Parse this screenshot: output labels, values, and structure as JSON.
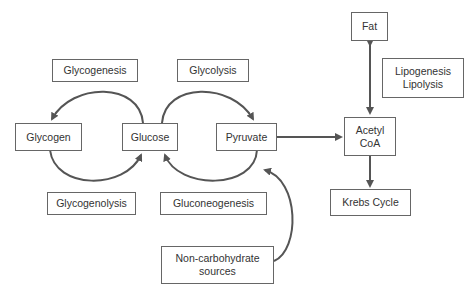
{
  "diagram": {
    "nodes": {
      "glycogenesis": "Glycogenesis",
      "glycolysis": "Glycolysis",
      "glycogen": "Glycogen",
      "glucose": "Glucose",
      "pyruvate": "Pyruvate",
      "glycogenolysis": "Glycogenolysis",
      "gluconeogenesis": "Gluconeogenesis",
      "non_carb": "Non-carbohydrate\nsources",
      "fat": "Fat",
      "lipo": "Lipogenesis\nLipolysis",
      "acetyl_coa": "Acetyl\nCoA",
      "krebs": "Krebs Cycle"
    },
    "edges": [
      {
        "from": "Glucose",
        "to": "Glycogen",
        "label": "Glycogenesis"
      },
      {
        "from": "Glycogen",
        "to": "Glucose",
        "label": "Glycogenolysis"
      },
      {
        "from": "Glucose",
        "to": "Pyruvate",
        "label": "Glycolysis"
      },
      {
        "from": "Pyruvate",
        "to": "Glucose",
        "label": "Gluconeogenesis"
      },
      {
        "from": "Non-carbohydrate sources",
        "to": "Pyruvate"
      },
      {
        "from": "Pyruvate",
        "to": "Acetyl CoA"
      },
      {
        "from": "Fat",
        "to": "Acetyl CoA",
        "bidirectional": true,
        "label": "Lipogenesis Lipolysis"
      },
      {
        "from": "Acetyl CoA",
        "to": "Krebs Cycle"
      }
    ],
    "colors": {
      "line": "#555555",
      "border": "#666666",
      "text": "#333333"
    }
  }
}
